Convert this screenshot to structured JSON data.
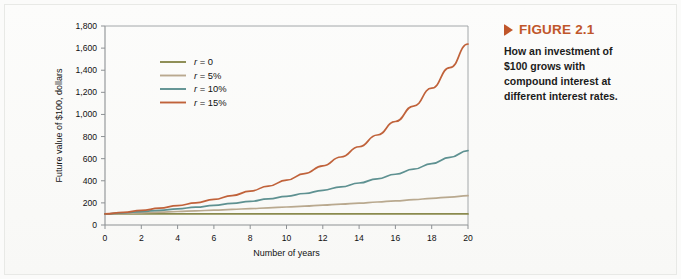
{
  "figure": {
    "marker_icon": "triangle-right-icon",
    "title": "FIGURE 2.1",
    "caption": "How an investment of $100 grows with compound interest at different interest rates.",
    "title_color": "#c0562a",
    "marker_color": "#c0562a"
  },
  "chart_data": {
    "type": "line",
    "title": "",
    "xlabel": "Number of years",
    "ylabel": "Future value of $100, dollars",
    "xlim": [
      0,
      20
    ],
    "ylim": [
      0,
      1800
    ],
    "xticks": [
      0,
      2,
      4,
      6,
      8,
      10,
      12,
      14,
      16,
      18,
      20
    ],
    "xtick_labels": [
      "0",
      "2",
      "4",
      "6",
      "8",
      "10",
      "12",
      "14",
      "16",
      "18",
      "20"
    ],
    "yticks": [
      0,
      200,
      400,
      600,
      800,
      1000,
      1200,
      1400,
      1600,
      1800
    ],
    "ytick_labels": [
      "0",
      "200",
      "400",
      "600",
      "800",
      "1,000",
      "1,200",
      "1,400",
      "1,600",
      "1,800"
    ],
    "grid": false,
    "legend_position": "upper-left-inside",
    "x": [
      0,
      1,
      2,
      3,
      4,
      5,
      6,
      7,
      8,
      9,
      10,
      11,
      12,
      13,
      14,
      15,
      16,
      17,
      18,
      19,
      20
    ],
    "series": [
      {
        "name": "r = 0",
        "rate": 0,
        "color": "#8a8a4e",
        "values": [
          100,
          100,
          100,
          100,
          100,
          100,
          100,
          100,
          100,
          100,
          100,
          100,
          100,
          100,
          100,
          100,
          100,
          100,
          100,
          100,
          100
        ]
      },
      {
        "name": "r = 5%",
        "rate": 0.05,
        "color": "#b9a98f",
        "values": [
          100,
          105,
          110,
          116,
          122,
          128,
          134,
          141,
          148,
          155,
          163,
          171,
          180,
          189,
          198,
          208,
          218,
          229,
          241,
          253,
          265
        ]
      },
      {
        "name": "r = 10%",
        "rate": 0.1,
        "color": "#5e9191",
        "values": [
          100,
          110,
          121,
          133,
          146,
          161,
          177,
          195,
          214,
          236,
          259,
          285,
          314,
          345,
          380,
          418,
          459,
          505,
          556,
          612,
          673
        ]
      },
      {
        "name": "r = 15%",
        "rate": 0.15,
        "color": "#c0623a",
        "values": [
          100,
          115,
          132,
          152,
          175,
          201,
          231,
          266,
          306,
          352,
          405,
          465,
          535,
          615,
          708,
          814,
          936,
          1076,
          1238,
          1423,
          1637
        ]
      }
    ]
  },
  "legend": {
    "items": [
      {
        "label_var": "r",
        "label_rest": " = 0"
      },
      {
        "label_var": "r",
        "label_rest": " = 5%"
      },
      {
        "label_var": "r",
        "label_rest": " = 10%"
      },
      {
        "label_var": "r",
        "label_rest": " = 15%"
      }
    ]
  }
}
